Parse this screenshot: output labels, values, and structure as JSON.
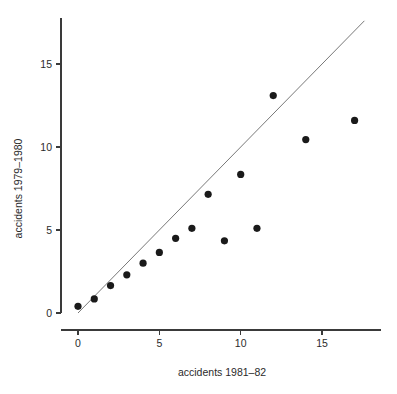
{
  "chart_data": {
    "type": "scatter",
    "title": "",
    "xlabel": "accidents 1981–82",
    "ylabel": "accidents 1979–1980",
    "xlim": [
      -0.7,
      18.4
    ],
    "ylim": [
      -0.8,
      17.9
    ],
    "xticks": [
      0,
      5,
      10,
      15
    ],
    "xtick_labels": [
      "0",
      "5",
      "10",
      "15"
    ],
    "yticks": [
      0,
      5,
      10,
      15
    ],
    "ytick_labels": [
      "0",
      "5",
      "10",
      "15"
    ],
    "grid": false,
    "legend": null,
    "marker": "filled-circle",
    "marker_color": "#1a1a1a",
    "x": [
      0,
      1,
      2,
      3,
      4,
      5,
      6,
      7,
      8,
      9,
      10,
      11,
      12,
      14,
      17
    ],
    "y": [
      0.4,
      0.85,
      1.65,
      2.3,
      3.0,
      3.65,
      4.5,
      5.1,
      7.15,
      4.35,
      8.35,
      5.1,
      13.1,
      10.45,
      11.6
    ],
    "points": [
      {
        "x": 0,
        "y": 0.4
      },
      {
        "x": 1,
        "y": 0.85
      },
      {
        "x": 2,
        "y": 1.65
      },
      {
        "x": 3,
        "y": 2.3
      },
      {
        "x": 4,
        "y": 3.0
      },
      {
        "x": 5,
        "y": 3.65
      },
      {
        "x": 6,
        "y": 4.5
      },
      {
        "x": 7,
        "y": 5.1
      },
      {
        "x": 8,
        "y": 7.15
      },
      {
        "x": 9,
        "y": 4.35
      },
      {
        "x": 10,
        "y": 8.35
      },
      {
        "x": 11,
        "y": 5.1
      },
      {
        "x": 12,
        "y": 13.1
      },
      {
        "x": 14,
        "y": 10.45
      },
      {
        "x": 17,
        "y": 11.6
      }
    ],
    "annotations": [
      {
        "name": "identity-reference-line",
        "type": "line",
        "x0": 0.0,
        "y0": 0.0,
        "x1": 17.6,
        "y1": 17.6,
        "color": "#555555"
      }
    ]
  }
}
